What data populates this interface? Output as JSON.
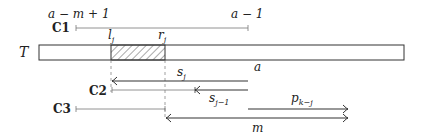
{
  "diagram": {
    "text_label": "T",
    "top_labels": {
      "left": "a − m + 1",
      "right": "a − 1"
    },
    "segment_labels": {
      "l": "l",
      "l_sub": "j",
      "r": "r",
      "r_sub": "j"
    },
    "cases": {
      "c1": "C1",
      "c2": "C2",
      "c3": "C3"
    },
    "arrows": {
      "s_j": {
        "base": "s",
        "sub": "j"
      },
      "a": "a",
      "s_j_minus_1": {
        "base": "s",
        "sub": "j−1"
      },
      "p_k_minus_j": {
        "base": "p",
        "sub": "k−j"
      },
      "m": "m"
    },
    "colors": {
      "stroke": "#333333",
      "light_stroke": "#777777",
      "background": "#ffffff"
    }
  }
}
